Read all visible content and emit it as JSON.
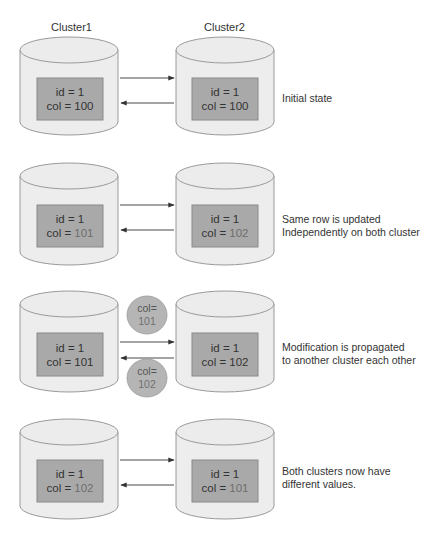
{
  "headers": {
    "cluster1": "Cluster1",
    "cluster2": "Cluster2"
  },
  "colors": {
    "cylinder_fill": "#ededed",
    "cylinder_stroke": "#9a9a9a",
    "box_fill": "#a9a9a9",
    "box_stroke": "#8a8a8a",
    "bubble_fill": "#b5b5b5",
    "arrow": "#333333",
    "highlight_text": "#6e6e6e"
  },
  "rows": [
    {
      "cluster1": {
        "id_line": "id = 1",
        "col_prefix": "col = ",
        "col_value": "100",
        "highlighted": false
      },
      "cluster2": {
        "id_line": "id = 1",
        "col_prefix": "col = ",
        "col_value": "100",
        "highlighted": false
      },
      "note": [
        "Initial state"
      ]
    },
    {
      "cluster1": {
        "id_line": "id = 1",
        "col_prefix": "col = ",
        "col_value": "101",
        "highlighted": true
      },
      "cluster2": {
        "id_line": "id = 1",
        "col_prefix": "col = ",
        "col_value": "102",
        "highlighted": true
      },
      "note": [
        "Same row is updated",
        "Independently on both cluster"
      ]
    },
    {
      "cluster1": {
        "id_line": "id = 1",
        "col_prefix": "col = ",
        "col_value": "101",
        "highlighted": false
      },
      "cluster2": {
        "id_line": "id = 1",
        "col_prefix": "col = ",
        "col_value": "102",
        "highlighted": false
      },
      "bubbles": [
        {
          "line1": "col=",
          "line2": "101",
          "direction": "cluster1-to-cluster2"
        },
        {
          "line1": "col=",
          "line2": "102",
          "direction": "cluster2-to-cluster1"
        }
      ],
      "note": [
        "Modification is propagated",
        "to another cluster each other"
      ]
    },
    {
      "cluster1": {
        "id_line": "id = 1",
        "col_prefix": "col = ",
        "col_value": "102",
        "highlighted": true
      },
      "cluster2": {
        "id_line": "id = 1",
        "col_prefix": "col = ",
        "col_value": "101",
        "highlighted": true
      },
      "note": [
        "Both clusters now have",
        "different values."
      ]
    }
  ]
}
